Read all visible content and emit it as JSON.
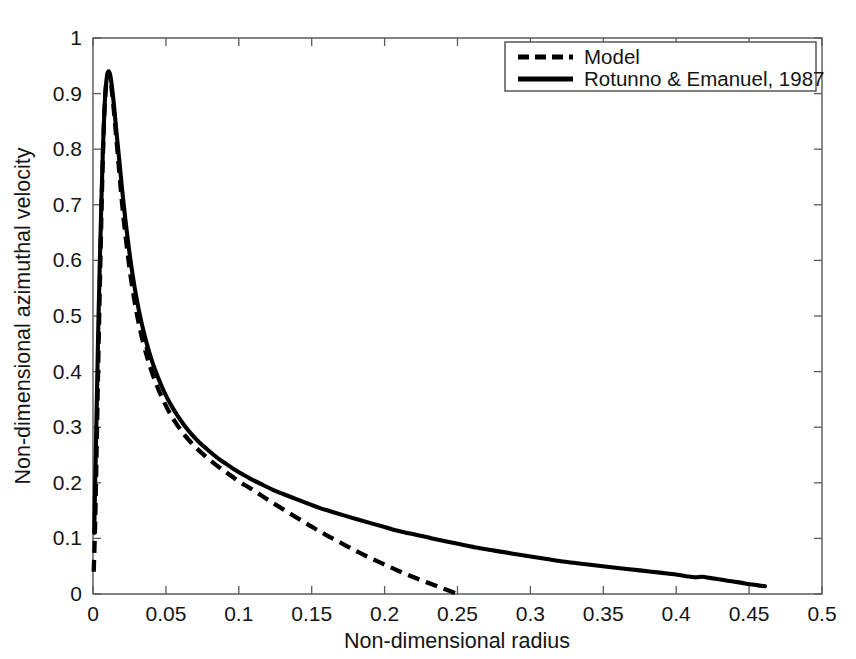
{
  "chart_data": {
    "type": "line",
    "title": "",
    "xlabel": "Non-dimensional radius",
    "ylabel": "Non-dimensional azimuthal velocity",
    "xlim": [
      0,
      0.5
    ],
    "ylim": [
      0,
      1
    ],
    "grid": false,
    "legend_position": "top-right",
    "xticks": [
      "0",
      "0.05",
      "0.1",
      "0.15",
      "0.2",
      "0.25",
      "0.3",
      "0.35",
      "0.4",
      "0.45",
      "0.5"
    ],
    "xtick_values": [
      0,
      0.05,
      0.1,
      0.15,
      0.2,
      0.25,
      0.3,
      0.35,
      0.4,
      0.45,
      0.5
    ],
    "yticks": [
      "0",
      "0.1",
      "0.2",
      "0.3",
      "0.4",
      "0.5",
      "0.6",
      "0.7",
      "0.8",
      "0.9",
      "1"
    ],
    "ytick_values": [
      0,
      0.1,
      0.2,
      0.3,
      0.4,
      0.5,
      0.6,
      0.7,
      0.8,
      0.9,
      1
    ],
    "series": [
      {
        "name": "Model",
        "style": "dashed",
        "color": "#000000",
        "points": [
          [
            0.0005,
            0.04
          ],
          [
            0.0015,
            0.13
          ],
          [
            0.0025,
            0.26
          ],
          [
            0.0035,
            0.4
          ],
          [
            0.0045,
            0.53
          ],
          [
            0.0055,
            0.65
          ],
          [
            0.0065,
            0.76
          ],
          [
            0.0075,
            0.845
          ],
          [
            0.0085,
            0.9
          ],
          [
            0.0095,
            0.928
          ],
          [
            0.0105,
            0.938
          ],
          [
            0.0115,
            0.932
          ],
          [
            0.0125,
            0.915
          ],
          [
            0.014,
            0.878
          ],
          [
            0.0155,
            0.835
          ],
          [
            0.017,
            0.79
          ],
          [
            0.019,
            0.73
          ],
          [
            0.021,
            0.675
          ],
          [
            0.0235,
            0.618
          ],
          [
            0.026,
            0.568
          ],
          [
            0.029,
            0.519
          ],
          [
            0.032,
            0.479
          ],
          [
            0.0355,
            0.441
          ],
          [
            0.039,
            0.41
          ],
          [
            0.043,
            0.38
          ],
          [
            0.047,
            0.355
          ],
          [
            0.0515,
            0.331
          ],
          [
            0.056,
            0.311
          ],
          [
            0.061,
            0.292
          ],
          [
            0.066,
            0.276
          ],
          [
            0.0715,
            0.261
          ],
          [
            0.077,
            0.248
          ],
          [
            0.083,
            0.235
          ],
          [
            0.089,
            0.223
          ],
          [
            0.095,
            0.212
          ],
          [
            0.101,
            0.201
          ],
          [
            0.108,
            0.19
          ],
          [
            0.115,
            0.178
          ],
          [
            0.122,
            0.166
          ],
          [
            0.13,
            0.153
          ],
          [
            0.14,
            0.137
          ],
          [
            0.15,
            0.121
          ],
          [
            0.16,
            0.106
          ],
          [
            0.17,
            0.092
          ],
          [
            0.18,
            0.078
          ],
          [
            0.19,
            0.065
          ],
          [
            0.2,
            0.053
          ],
          [
            0.21,
            0.041
          ],
          [
            0.22,
            0.03
          ],
          [
            0.23,
            0.02
          ],
          [
            0.24,
            0.01
          ],
          [
            0.249,
            0.001
          ]
        ]
      },
      {
        "name": "Rotunno & Emanuel, 1987",
        "style": "solid",
        "color": "#000000",
        "points": [
          [
            0.0008,
            0.11
          ],
          [
            0.0018,
            0.24
          ],
          [
            0.0028,
            0.37
          ],
          [
            0.0038,
            0.5
          ],
          [
            0.0048,
            0.61
          ],
          [
            0.0058,
            0.71
          ],
          [
            0.0068,
            0.8
          ],
          [
            0.0078,
            0.868
          ],
          [
            0.0088,
            0.912
          ],
          [
            0.0098,
            0.934
          ],
          [
            0.0108,
            0.94
          ],
          [
            0.0118,
            0.933
          ],
          [
            0.013,
            0.912
          ],
          [
            0.0145,
            0.876
          ],
          [
            0.016,
            0.833
          ],
          [
            0.0178,
            0.786
          ],
          [
            0.0198,
            0.732
          ],
          [
            0.022,
            0.678
          ],
          [
            0.0245,
            0.624
          ],
          [
            0.027,
            0.577
          ],
          [
            0.03,
            0.53
          ],
          [
            0.0332,
            0.489
          ],
          [
            0.0366,
            0.453
          ],
          [
            0.0402,
            0.421
          ],
          [
            0.0442,
            0.392
          ],
          [
            0.0484,
            0.366
          ],
          [
            0.0528,
            0.343
          ],
          [
            0.0574,
            0.323
          ],
          [
            0.0622,
            0.305
          ],
          [
            0.0674,
            0.288
          ],
          [
            0.0728,
            0.273
          ],
          [
            0.0784,
            0.26
          ],
          [
            0.0842,
            0.247
          ],
          [
            0.0902,
            0.236
          ],
          [
            0.0964,
            0.225
          ],
          [
            0.1028,
            0.215
          ],
          [
            0.1096,
            0.205
          ],
          [
            0.1166,
            0.196
          ],
          [
            0.1238,
            0.187
          ],
          [
            0.1312,
            0.179
          ],
          [
            0.139,
            0.171
          ],
          [
            0.147,
            0.163
          ],
          [
            0.1552,
            0.155
          ],
          [
            0.1638,
            0.148
          ],
          [
            0.1726,
            0.141
          ],
          [
            0.1816,
            0.134
          ],
          [
            0.191,
            0.127
          ],
          [
            0.2006,
            0.12
          ],
          [
            0.2104,
            0.113
          ],
          [
            0.2206,
            0.107
          ],
          [
            0.231,
            0.101
          ],
          [
            0.2416,
            0.095
          ],
          [
            0.2526,
            0.089
          ],
          [
            0.2638,
            0.083
          ],
          [
            0.2752,
            0.078
          ],
          [
            0.287,
            0.073
          ],
          [
            0.299,
            0.068
          ],
          [
            0.3112,
            0.063
          ],
          [
            0.3238,
            0.058
          ],
          [
            0.3366,
            0.054
          ],
          [
            0.3496,
            0.05
          ],
          [
            0.363,
            0.046
          ],
          [
            0.3766,
            0.042
          ],
          [
            0.3904,
            0.038
          ],
          [
            0.4,
            0.035
          ],
          [
            0.407,
            0.032
          ],
          [
            0.413,
            0.03
          ],
          [
            0.418,
            0.031
          ],
          [
            0.423,
            0.029
          ],
          [
            0.43,
            0.026
          ],
          [
            0.438,
            0.023
          ],
          [
            0.445,
            0.02
          ],
          [
            0.452,
            0.017
          ],
          [
            0.458,
            0.015
          ],
          [
            0.461,
            0.014
          ]
        ]
      }
    ],
    "legend": [
      {
        "label": "Model",
        "style": "dashed"
      },
      {
        "label": "Rotunno & Emanuel, 1987",
        "style": "solid"
      }
    ],
    "annotations": {
      "peak_value": 0.94,
      "model_zero_crossing": 0.25,
      "data_max_radius": 0.461
    }
  }
}
